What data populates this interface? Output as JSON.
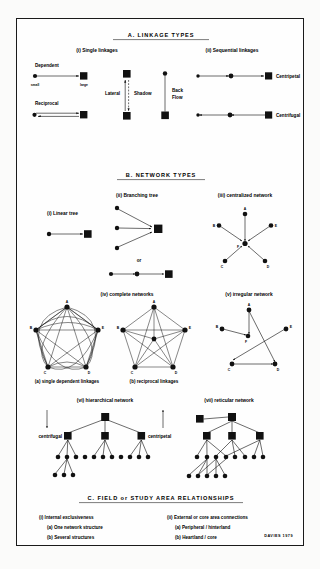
{
  "figure": {
    "credit": "DAVIES 1979",
    "sections": {
      "a": {
        "title": "A.  LINKAGE  TYPES",
        "sub_i": "(i) Single linkages",
        "sub_ii": "(ii) Sequential linkages",
        "labels": {
          "dependent": "Dependent",
          "reciprocal": "Reciprocal",
          "small": "small",
          "large": "large",
          "lateral": "Lateral",
          "shadow": "Shadow",
          "back": "Back",
          "flow": "Flow",
          "centripetal": "Centripetal",
          "centrifugal": "Centrifugal"
        }
      },
      "b": {
        "title": "B.  NETWORK  TYPES",
        "sub_i": "(i) Linear tree",
        "sub_ii": "(ii) Branching tree",
        "sub_iii": "(iii) centralized network",
        "sub_iv": "(iv) complete networks",
        "sub_v": "(v) irregular network",
        "sub_vi": "(vi) hierarchical network",
        "sub_vii": "(vii) reticular network",
        "or": "or",
        "complete_a": "(a) single dependent linkages",
        "complete_b": "(b) reciprocal linkages",
        "centrifugal": "centrifugal",
        "centripetal": "centripetal",
        "node_labels": [
          "A",
          "B",
          "C",
          "D",
          "E",
          "F"
        ]
      },
      "c": {
        "title": "C.  FIELD  or  STUDY  AREA  RELATIONSHIPS",
        "col1_head": "(i) Internal exclusiveness",
        "col1_a": "(a) One network structure",
        "col1_b": "(b) Several structures",
        "col2_head": "(ii) External or core area connections",
        "col2_a": "(a) Peripheral / hinterland",
        "col2_b": "(b) Heartland / core"
      }
    },
    "colors": {
      "ink": "#111111",
      "paper": "#fefefe",
      "page": "#fbfbfa"
    }
  }
}
